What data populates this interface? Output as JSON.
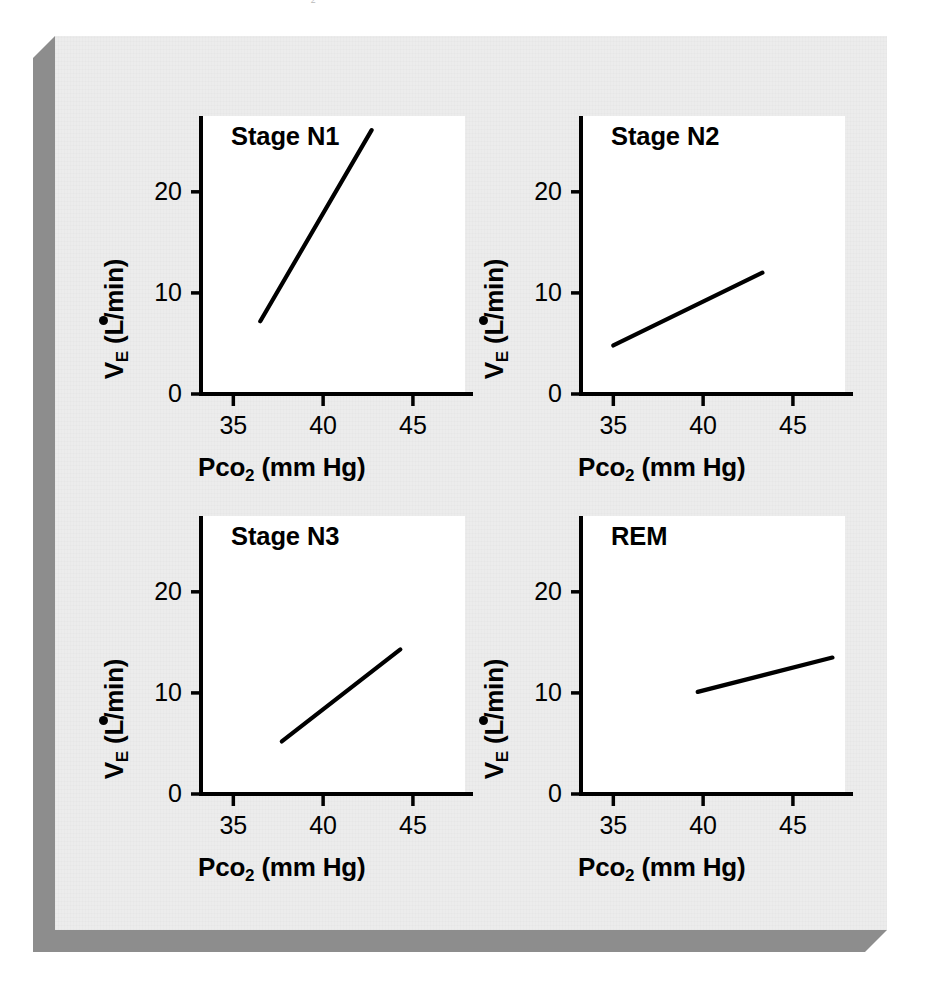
{
  "figure": {
    "clipped_header_fragment": "CO2",
    "background_color": "#ececec",
    "slab_shadow_color": "#8d8d8d",
    "line_color": "#000000",
    "axis_color": "#000000"
  },
  "axes_common": {
    "x_label_main": "P",
    "x_label_lower": "co",
    "x_label_sub": "2",
    "x_label_units": " (mm Hg)",
    "y_label_v": "V",
    "y_label_sub": "E",
    "y_label_units": " (L/min)",
    "x_ticks": [
      "35",
      "40",
      "45"
    ],
    "y_ticks": [
      "0",
      "10",
      "20"
    ]
  },
  "chart_data": {
    "type": "line",
    "xlabel": "Pco2 (mm Hg)",
    "ylabel": "VE (L/min)",
    "xlim": [
      33.2,
      47.9
    ],
    "ylim": [
      0,
      27.5
    ],
    "x_ticks": [
      35,
      40,
      45
    ],
    "y_ticks": [
      0,
      10,
      20
    ],
    "grid": false,
    "legend": "none",
    "panels": [
      {
        "id": "stage-n1",
        "label": "Stage N1",
        "series": [
          {
            "name": "Stage N1 CO2 response slope",
            "x": [
              36.5,
              42.7
            ],
            "y": [
              7.2,
              26.1
            ],
            "slope": 3.05,
            "intercept": -104.1
          }
        ]
      },
      {
        "id": "stage-n2",
        "label": "Stage N2",
        "series": [
          {
            "name": "Stage N2 CO2 response slope",
            "x": [
              35.0,
              43.3
            ],
            "y": [
              4.8,
              12.0
            ],
            "slope": 0.87,
            "intercept": -25.6
          }
        ]
      },
      {
        "id": "stage-n3",
        "label": "Stage N3",
        "series": [
          {
            "name": "Stage N3 CO2 response slope",
            "x": [
              37.7,
              44.3
            ],
            "y": [
              5.2,
              14.3
            ],
            "slope": 1.38,
            "intercept": -46.7
          }
        ]
      },
      {
        "id": "rem",
        "label": "REM",
        "series": [
          {
            "name": "REM CO2 response slope",
            "x": [
              39.7,
              47.2
            ],
            "y": [
              10.1,
              13.5
            ],
            "slope": 0.45,
            "intercept": -7.9
          }
        ]
      }
    ]
  }
}
